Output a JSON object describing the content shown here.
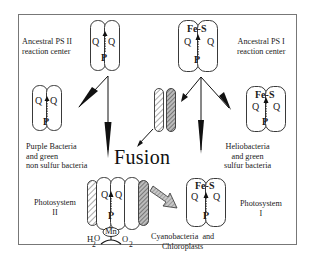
{
  "figure": {
    "title_center": "Fusion",
    "nodes": {
      "ancestral_ps2": {
        "label_line1": "Ancestral PS II",
        "label_line2": "reaction center",
        "left_cofactor": "Q",
        "right_cofactor": "Q",
        "bottom_cofactor": "P"
      },
      "ancestral_ps1": {
        "label_line1": "Ancestral PS I",
        "label_line2": "reaction center",
        "top_cofactor": "Fe-S",
        "left_cofactor": "Q",
        "right_cofactor": "Q",
        "bottom_cofactor": "P"
      },
      "purple_bacteria": {
        "label_line1": "Purple Bacteria",
        "label_line2": "and green",
        "label_line3": "non sulfur bacteria",
        "left_cofactor": "Q",
        "right_cofactor": "Q",
        "bottom_cofactor": "P"
      },
      "heliobacteria": {
        "label_line1": "Heliobacteria",
        "label_line2": "and green",
        "label_line3": "sulfur bacteria",
        "top_cofactor": "Fe-S",
        "left_cofactor": "Q",
        "right_cofactor": "Q",
        "bottom_cofactor": "P"
      },
      "photosystem2": {
        "label_line1": "Photosystem",
        "label_line2": "II",
        "left_cofactor": "Q",
        "right_cofactor": "Q",
        "bottom_cofactor": "P",
        "cluster": "Mn",
        "substrate": "H",
        "substrate_sub": "2",
        "substrate_tail": "O",
        "product": "O",
        "product_sub": "2"
      },
      "photosystem1": {
        "label_line1": "Photosystem",
        "label_line2": "I",
        "top_cofactor": "Fe-S",
        "left_cofactor": "Q",
        "right_cofactor": "Q",
        "bottom_cofactor": "P"
      },
      "cyanobacteria": {
        "label_line1": "Cyanobacteria  and",
        "label_line2": "Chloroplasts"
      }
    },
    "colors": {
      "line": "#111111",
      "border": "#777777",
      "arrow_fill": "#aaaaaa",
      "background": "#ffffff"
    }
  }
}
